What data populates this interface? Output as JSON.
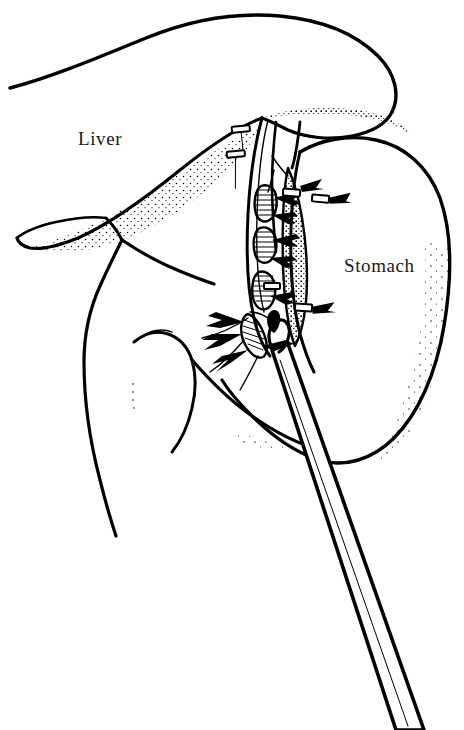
{
  "figure": {
    "background_color": "#ffffff",
    "ink_color": "#000000",
    "width": 464,
    "height": 730,
    "style": "line-art-stipple"
  },
  "labels": [
    {
      "name": "liver-label",
      "text": "Liver",
      "x": 78,
      "y": 145,
      "font_size": 19
    },
    {
      "name": "stomach-label",
      "text": "Stomach",
      "x": 344,
      "y": 272,
      "font_size": 19
    }
  ],
  "structures": [
    {
      "name": "liver",
      "label": "Liver",
      "shading": "stipple-lower-edge"
    },
    {
      "name": "stomach",
      "label": "Stomach",
      "shading": "stipple-right-edge"
    },
    {
      "name": "lesser-curvature",
      "label": "",
      "shading": "stipple-strip"
    },
    {
      "name": "duodenum",
      "label": "",
      "shading": "none"
    },
    {
      "name": "gastrohepatic-ligament",
      "label": "",
      "shading": "hatched-vessels"
    }
  ],
  "instruments": [
    {
      "name": "laparoscopic-grasper",
      "type": "shaft-with-tip",
      "tip_x": 278,
      "tip_y": 343,
      "exit_x": 408,
      "exit_y": 730
    }
  ],
  "clips": [
    {
      "name": "clip-upper-left-1",
      "x": 241,
      "y": 131,
      "angle": -8
    },
    {
      "name": "clip-upper-left-2",
      "x": 238,
      "y": 155,
      "angle": -8
    },
    {
      "name": "clip-mid-right-1",
      "x": 291,
      "y": 192,
      "angle": 6
    },
    {
      "name": "clip-mid-right-2",
      "x": 320,
      "y": 198,
      "angle": 6
    },
    {
      "name": "clip-lower-right",
      "x": 303,
      "y": 307,
      "angle": 4
    },
    {
      "name": "clip-mid-inner",
      "x": 272,
      "y": 286,
      "angle": 0
    }
  ]
}
